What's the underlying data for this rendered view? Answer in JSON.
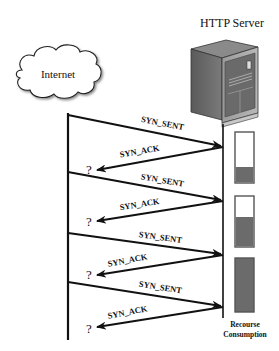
{
  "server": {
    "title": "HTTP Server",
    "icon": "server-tower-icon"
  },
  "cloud": {
    "label": "Internet",
    "icon": "cloud-icon"
  },
  "messages": [
    {
      "label": "SYN_SENT",
      "direction": "client-to-server"
    },
    {
      "label": "SYN_ACK",
      "direction": "server-to-client"
    },
    {
      "label": "SYN_SENT",
      "direction": "client-to-server"
    },
    {
      "label": "SYN_ACK",
      "direction": "server-to-client"
    },
    {
      "label": "SYN_SENT",
      "direction": "client-to-server"
    },
    {
      "label": "SYN_ACK",
      "direction": "server-to-client"
    },
    {
      "label": "SYN_SENT",
      "direction": "client-to-server"
    },
    {
      "label": "SYN_ACK",
      "direction": "server-to-client"
    }
  ],
  "unknown_marks": [
    "?",
    "?",
    "?",
    "?"
  ],
  "resource": {
    "caption_line1": "Recourse",
    "caption_line2": "Consumption",
    "bars": [
      {
        "fill_fraction": 0.32
      },
      {
        "fill_fraction": 0.6
      },
      {
        "fill_fraction": 1.0
      }
    ],
    "fill_color": "#6b6b6b",
    "border_color": "#555555"
  }
}
